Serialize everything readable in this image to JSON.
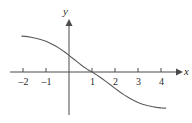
{
  "chart_data": {
    "type": "line",
    "title": "",
    "subtitle": "",
    "xlabel": "x",
    "ylabel": "y",
    "xlim": [
      -2.4,
      4.8
    ],
    "ylim": [
      -1.9,
      2.1
    ],
    "grid": false,
    "legend": null,
    "annotations": [],
    "x_ticks": [
      -2,
      -1,
      1,
      2,
      3,
      4
    ],
    "x_tick_labels": [
      "–2",
      "–1",
      "1",
      "2",
      "3",
      "4"
    ],
    "y_ticks": [],
    "y_tick_labels": [],
    "series": [
      {
        "name": "curve",
        "color": "#5a5a5a",
        "x": [
          -2.05,
          -1.8,
          -1.6,
          -1.4,
          -1.2,
          -1.0,
          -0.8,
          -0.6,
          -0.4,
          -0.2,
          0.0,
          0.2,
          0.4,
          0.6,
          0.8,
          1.0,
          1.2,
          1.4,
          1.6,
          1.8,
          2.0,
          2.2,
          2.4,
          2.6,
          2.8,
          3.0,
          3.2,
          3.4,
          3.6,
          3.8,
          4.0,
          4.2
        ],
        "y": [
          1.38,
          1.36,
          1.33,
          1.29,
          1.24,
          1.18,
          1.1,
          1.01,
          0.9,
          0.78,
          0.64,
          0.5,
          0.36,
          0.22,
          0.1,
          0.0,
          -0.11,
          -0.23,
          -0.36,
          -0.49,
          -0.63,
          -0.76,
          -0.88,
          -0.99,
          -1.09,
          -1.17,
          -1.24,
          -1.29,
          -1.33,
          -1.36,
          -1.38,
          -1.39
        ]
      }
    ],
    "features": {
      "shape": "decreasing sigmoid",
      "x_intercept": 1,
      "y_intercept": 0.64,
      "inflection_point": [
        1,
        0
      ],
      "left_asymptote": 1.4,
      "right_asymptote": -1.4
    }
  },
  "axes": {
    "x_axis_label": "x",
    "y_axis_label": "y",
    "axis_color": "#4a4a4a",
    "curve_color": "#5a5a5a",
    "background": "#ffffff"
  },
  "ticks": [
    {
      "label": "–2",
      "left": 15,
      "top": 76
    },
    {
      "label": "–1",
      "left": 38,
      "top": 76
    },
    {
      "label": "1",
      "left": 87,
      "top": 76
    },
    {
      "label": "2",
      "left": 110,
      "top": 76
    },
    {
      "label": "3",
      "left": 133,
      "top": 76
    },
    {
      "label": "4",
      "left": 156,
      "top": 76
    }
  ]
}
